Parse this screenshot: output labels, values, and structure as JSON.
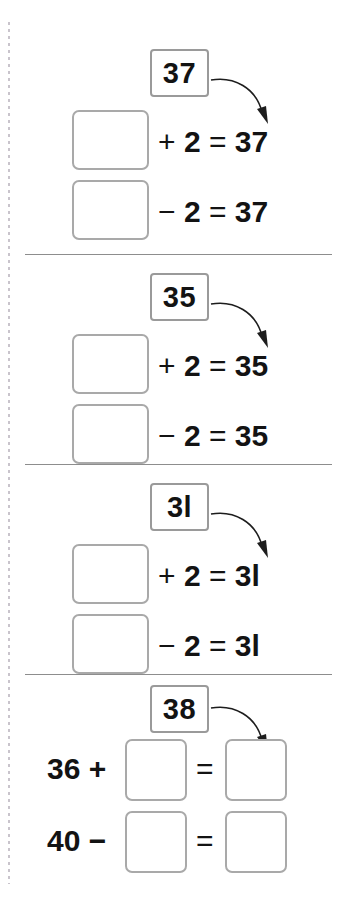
{
  "page": {
    "type": "math-worksheet",
    "background_color": "#ffffff",
    "box_border_color": "#a9a9a9",
    "divider_color": "#8d8d8d",
    "text_color": "#131313",
    "margin_dot_color": "#c9c4cc"
  },
  "sections": [
    {
      "id": "section-1",
      "given_number": "37",
      "rows": [
        {
          "blank": "",
          "operator": "+",
          "operand": "2",
          "equals": "=",
          "result": "37"
        },
        {
          "blank": "",
          "operator": "−",
          "operand": "2",
          "equals": "=",
          "result": "37"
        }
      ]
    },
    {
      "id": "section-2",
      "given_number": "35",
      "rows": [
        {
          "blank": "",
          "operator": "+",
          "operand": "2",
          "equals": "=",
          "result": "35"
        },
        {
          "blank": "",
          "operator": "−",
          "operand": "2",
          "equals": "=",
          "result": "35"
        }
      ]
    },
    {
      "id": "section-3",
      "given_number": "3l",
      "rows": [
        {
          "blank": "",
          "operator": "+",
          "operand": "2",
          "equals": "=",
          "result": "3l"
        },
        {
          "blank": "",
          "operator": "−",
          "operand": "2",
          "equals": "=",
          "result": "3l"
        }
      ]
    },
    {
      "id": "section-4",
      "given_number": "38",
      "rows": [
        {
          "lead": "36",
          "operator": "+",
          "blank_left": "",
          "equals": "=",
          "blank_right": ""
        },
        {
          "lead": "40",
          "operator": "−",
          "blank_left": "",
          "equals": "=",
          "blank_right": ""
        }
      ]
    }
  ],
  "icons": {
    "arrow": "curved-arrow-icon"
  }
}
